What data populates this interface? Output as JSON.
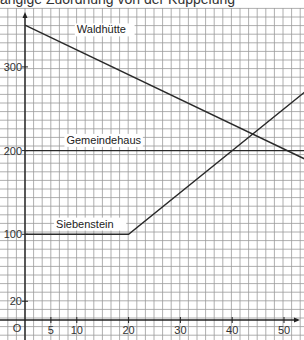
{
  "header": {
    "clipped_text": "ängige Zuordnung von der Kuppelung"
  },
  "chart_data": {
    "type": "line",
    "title": "",
    "xlabel": "",
    "ylabel": "",
    "xlim": [
      0,
      54
    ],
    "ylim": [
      0,
      360
    ],
    "grid": true,
    "origin_label": "O",
    "x_ticks": [
      5,
      10,
      20,
      30,
      40,
      50
    ],
    "y_ticks": [
      20,
      100,
      200,
      300
    ],
    "series": [
      {
        "name": "Waldhütte",
        "points": [
          [
            0,
            350
          ],
          [
            54,
            190
          ]
        ],
        "label_at": [
          10,
          340
        ]
      },
      {
        "name": "Gemeindehaus",
        "points": [
          [
            0,
            200
          ],
          [
            54,
            200
          ]
        ],
        "label_at": [
          8,
          208
        ]
      },
      {
        "name": "Siebenstein",
        "points": [
          [
            0,
            100
          ],
          [
            20,
            100
          ],
          [
            54,
            270
          ]
        ],
        "label_at": [
          6,
          108
        ]
      }
    ]
  },
  "colors": {
    "grid": "#9a9a9a",
    "axis": "#222222",
    "line": "#2a2a2a"
  }
}
